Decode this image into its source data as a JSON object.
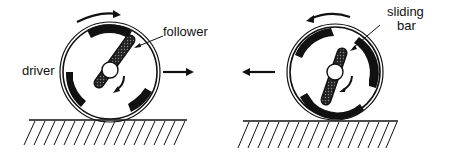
{
  "figure": {
    "left_panel": {
      "labels": {
        "driver": "driver",
        "follower": "follower"
      },
      "wheel_rotation": "clockwise",
      "bar_rotation": "counterclockwise",
      "motion_direction": "right"
    },
    "right_panel": {
      "labels": {
        "sliding_bar_line1": "sliding",
        "sliding_bar_line2": "bar"
      },
      "wheel_rotation": "counterclockwise",
      "bar_rotation": "clockwise",
      "motion_direction": "left"
    },
    "colors": {
      "ink": "#111111",
      "background": "#ffffff"
    }
  }
}
